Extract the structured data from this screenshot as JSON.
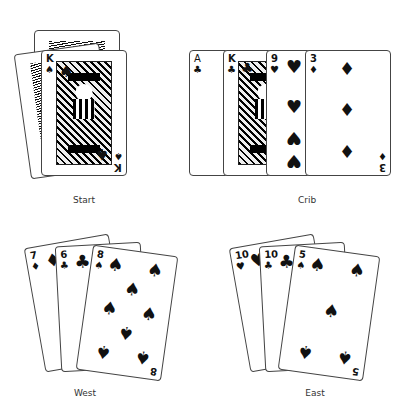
{
  "zones": [
    {
      "id": "start",
      "label": "Start",
      "cards": [
        {
          "rank": "K",
          "suit": "♠",
          "face_up": true
        }
      ],
      "back_cards": 2
    },
    {
      "id": "crib",
      "label": "Crib",
      "cards": [
        {
          "rank": "A",
          "suit": "♣"
        },
        {
          "rank": "K",
          "suit": "♣"
        },
        {
          "rank": "9",
          "suit": "♥"
        },
        {
          "rank": "3",
          "suit": "♦"
        }
      ]
    },
    {
      "id": "west",
      "label": "West",
      "cards": [
        {
          "rank": "7",
          "suit": "♦"
        },
        {
          "rank": "6",
          "suit": "♣"
        },
        {
          "rank": "8",
          "suit": "♠"
        }
      ]
    },
    {
      "id": "east",
      "label": "East",
      "cards": [
        {
          "rank": "10",
          "suit": "♥"
        },
        {
          "rank": "10",
          "suit": "♣"
        },
        {
          "rank": "5",
          "suit": "♠"
        }
      ]
    }
  ]
}
